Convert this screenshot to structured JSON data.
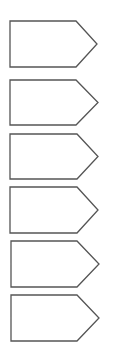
{
  "diagram": {
    "type": "pentagon-arrow-stack",
    "stroke_color": "#555555",
    "fill_color": "#ffffff",
    "stroke_width": 1.3,
    "shapes": [
      {
        "id": "arrow-1",
        "label": "",
        "x": 10,
        "y": 21,
        "body_width": 66,
        "tip_x": 97,
        "height": 46
      },
      {
        "id": "arrow-2",
        "label": "",
        "x": 10,
        "y": 80,
        "body_width": 66,
        "tip_x": 98,
        "height": 45
      },
      {
        "id": "arrow-3",
        "label": "",
        "x": 10,
        "y": 134,
        "body_width": 67,
        "tip_x": 98,
        "height": 45
      },
      {
        "id": "arrow-4",
        "label": "",
        "x": 10,
        "y": 187,
        "body_width": 67,
        "tip_x": 98,
        "height": 46
      },
      {
        "id": "arrow-5",
        "label": "",
        "x": 11,
        "y": 241,
        "body_width": 66,
        "tip_x": 99,
        "height": 46
      },
      {
        "id": "arrow-6",
        "label": "",
        "x": 11,
        "y": 295,
        "body_width": 66,
        "tip_x": 99,
        "height": 46
      }
    ]
  }
}
